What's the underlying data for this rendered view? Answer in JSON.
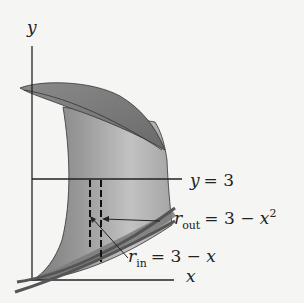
{
  "diagram": {
    "axis_labels": {
      "y": "y",
      "x": "x"
    },
    "line_label": {
      "var": "y",
      "eq": "= 3"
    },
    "r_out": {
      "symbol": "r",
      "sub": "out",
      "eq": "= 3 − ",
      "var": "x",
      "exp": "2"
    },
    "r_in": {
      "symbol": "r",
      "sub": "in",
      "eq": "= 3 − ",
      "var": "x"
    },
    "colors": {
      "background": "#f5f5f3",
      "surface_light": "#c8c8c8",
      "surface_dark": "#6e6e6e",
      "stroke": "#222222"
    }
  }
}
